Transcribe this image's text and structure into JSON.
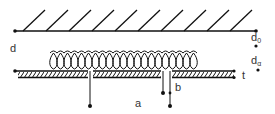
{
  "diagram": {
    "type": "schematic",
    "colors": {
      "stroke": "#111111",
      "text": "#333333",
      "background": "#ffffff"
    },
    "labels": {
      "d": "d",
      "d0_main": "d",
      "d0_sub": "0",
      "da_main": "d",
      "da_sub": "α",
      "t": "t",
      "a": "a",
      "b": "b"
    },
    "elements": [
      {
        "id": "ground-plane",
        "kind": "hatched-line",
        "y": 31
      },
      {
        "id": "coil-layer",
        "kind": "loops",
        "count": 20
      },
      {
        "id": "substrate",
        "kind": "hatched-strip",
        "y": 72
      },
      {
        "id": "lead-a",
        "kind": "terminal",
        "label": "a"
      },
      {
        "id": "lead-b",
        "kind": "terminal-pair",
        "label": "b"
      }
    ]
  }
}
